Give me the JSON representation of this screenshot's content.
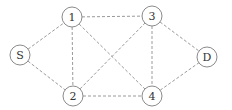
{
  "diagram": {
    "type": "network-graph",
    "node_radius": 10,
    "nodes": [
      {
        "id": "S",
        "label": "S",
        "x": 20,
        "y": 55
      },
      {
        "id": "1",
        "label": "1",
        "x": 72,
        "y": 17
      },
      {
        "id": "2",
        "label": "2",
        "x": 73,
        "y": 96
      },
      {
        "id": "3",
        "label": "3",
        "x": 152,
        "y": 16
      },
      {
        "id": "4",
        "label": "4",
        "x": 152,
        "y": 96
      },
      {
        "id": "D",
        "label": "D",
        "x": 207,
        "y": 57
      }
    ],
    "edges": [
      {
        "from": "S",
        "to": "1"
      },
      {
        "from": "S",
        "to": "2"
      },
      {
        "from": "1",
        "to": "2"
      },
      {
        "from": "1",
        "to": "3"
      },
      {
        "from": "1",
        "to": "4"
      },
      {
        "from": "2",
        "to": "3"
      },
      {
        "from": "2",
        "to": "4"
      },
      {
        "from": "3",
        "to": "4"
      },
      {
        "from": "3",
        "to": "D"
      },
      {
        "from": "4",
        "to": "D"
      }
    ],
    "edge_style": "dashed",
    "colors": {
      "edge": "#9a9a9a",
      "node_stroke": "#8a8a8a",
      "label": "#333333"
    }
  }
}
